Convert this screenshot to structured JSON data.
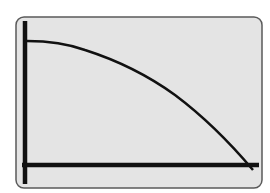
{
  "screen": {
    "background": "#e4e4e4",
    "border_color": "#5a5a5a",
    "line_color": "#111111"
  },
  "graph": {
    "description": "Decreasing concave-down curve on calculator graph screen",
    "x_axis": "horizontal axis near bottom",
    "y_axis": "vertical axis at left",
    "curve_start": "y-intercept near top left",
    "curve_end": "x-intercept near bottom right"
  }
}
